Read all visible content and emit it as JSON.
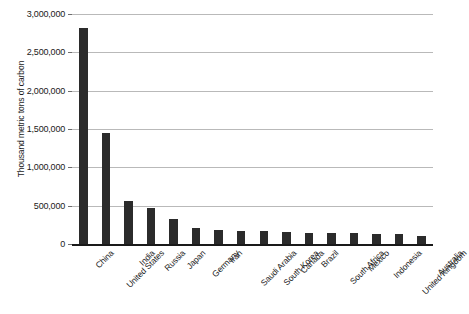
{
  "chart_data": {
    "type": "bar",
    "title": "",
    "subtitle": "",
    "xlabel": "",
    "ylabel": "Thousand metric tons of carbon",
    "ylim": [
      0,
      3000000
    ],
    "ytick_labels": [
      "0",
      "500,000",
      "1,000,000",
      "1,500,000",
      "2,000,000",
      "2,500,000",
      "3,000,000"
    ],
    "ytick_values": [
      0,
      500000,
      1000000,
      1500000,
      2000000,
      2500000,
      3000000
    ],
    "grid": true,
    "legend": false,
    "bar_color": "#2b2b2b",
    "gridline_color": "#b9b9b9",
    "axis_color": "#1a1a1a",
    "categories": [
      "China",
      "United States",
      "India",
      "Russia",
      "Japan",
      "Germany",
      "Iran",
      "Saudi Arabia",
      "South Korea",
      "Canada",
      "Brazil",
      "South Africa",
      "Mexico",
      "Indonesia",
      "United Kingdom",
      "Australia"
    ],
    "values": [
      2820000,
      1450000,
      560000,
      465000,
      330000,
      210000,
      180000,
      165000,
      165000,
      160000,
      150000,
      145000,
      140000,
      135000,
      130000,
      110000
    ]
  }
}
